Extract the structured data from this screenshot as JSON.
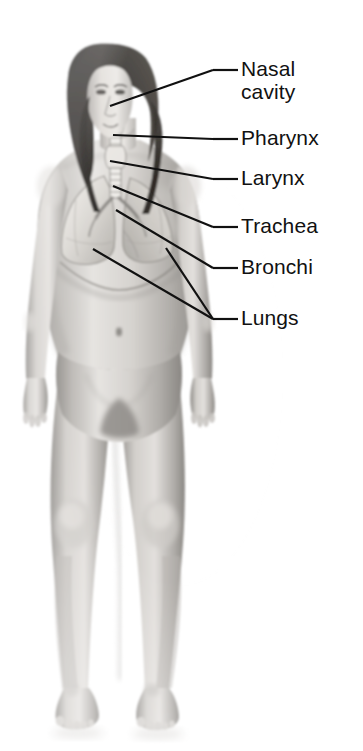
{
  "diagram": {
    "background_color": "#ffffff",
    "line_color": "#111111",
    "text_color": "#111111",
    "body_tone_light": "#e9e7e4",
    "body_tone_mid": "#b9b6b2",
    "body_tone_dark": "#7d7a76",
    "hair_color": "#15120f",
    "organ_color": "#dedbd6"
  },
  "labels": [
    {
      "id": "nasal-cavity",
      "line1": "Nasal",
      "line2": "cavity",
      "text_x": 241,
      "text_y": 57,
      "dash": {
        "x1": 213,
        "y1": 70,
        "x2": 238,
        "y2": 70
      },
      "leader": {
        "x1": 110,
        "y1": 106,
        "x2": 213,
        "y2": 70
      }
    },
    {
      "id": "pharynx",
      "line1": "Pharynx",
      "line2": "",
      "text_x": 241,
      "text_y": 126,
      "dash": {
        "x1": 213,
        "y1": 139,
        "x2": 238,
        "y2": 139
      },
      "leader": {
        "x1": 113,
        "y1": 135,
        "x2": 213,
        "y2": 139
      }
    },
    {
      "id": "larynx",
      "line1": "Larynx",
      "line2": "",
      "text_x": 241,
      "text_y": 166,
      "dash": {
        "x1": 213,
        "y1": 179,
        "x2": 238,
        "y2": 179
      },
      "leader": {
        "x1": 110,
        "y1": 161,
        "x2": 213,
        "y2": 179
      }
    },
    {
      "id": "trachea",
      "line1": "Trachea",
      "line2": "",
      "text_x": 241,
      "text_y": 214,
      "dash": {
        "x1": 213,
        "y1": 227,
        "x2": 238,
        "y2": 227
      },
      "leader": {
        "x1": 113,
        "y1": 186,
        "x2": 213,
        "y2": 227
      }
    },
    {
      "id": "bronchi",
      "line1": "Bronchi",
      "line2": "",
      "text_x": 241,
      "text_y": 255,
      "dash": {
        "x1": 213,
        "y1": 268,
        "x2": 238,
        "y2": 268
      },
      "leader": {
        "x1": 116,
        "y1": 210,
        "x2": 213,
        "y2": 268
      }
    },
    {
      "id": "lungs",
      "line1": "Lungs",
      "line2": "",
      "text_x": 241,
      "text_y": 306,
      "dash": {
        "x1": 213,
        "y1": 319,
        "x2": 238,
        "y2": 319
      },
      "leader": {
        "x1": 93,
        "y1": 249,
        "x2": 213,
        "y2": 319
      },
      "leader2": {
        "x1": 166,
        "y1": 248,
        "x2": 213,
        "y2": 319
      }
    }
  ],
  "anatomy_parts": [
    "nasal cavity",
    "pharynx",
    "larynx",
    "trachea",
    "bronchi",
    "left lung",
    "right lung",
    "diaphragm",
    "head",
    "hair",
    "torso",
    "left arm",
    "right arm",
    "left leg",
    "right leg",
    "left foot",
    "right foot"
  ]
}
